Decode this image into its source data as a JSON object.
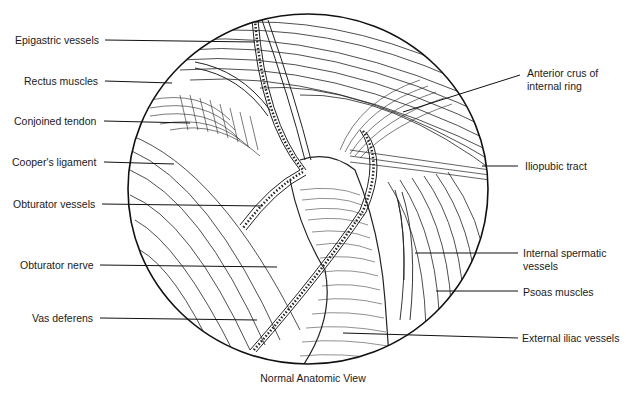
{
  "figure": {
    "caption": "Normal Anatomic View",
    "left_labels": [
      {
        "id": "epigastric-vessels",
        "text": "Epigastric vessels",
        "x": 15,
        "y": 35
      },
      {
        "id": "rectus-muscles",
        "text": "Rectus muscles",
        "x": 24,
        "y": 76
      },
      {
        "id": "conjoined-tendon",
        "text": "Conjoined tendon",
        "x": 14,
        "y": 116
      },
      {
        "id": "coopers-ligament",
        "text": "Cooper's ligament",
        "x": 12,
        "y": 155
      },
      {
        "id": "obturator-vessels",
        "text": "Obturator vessels",
        "x": 13,
        "y": 197
      },
      {
        "id": "obturator-nerve",
        "text": "Obturator nerve",
        "x": 20,
        "y": 258
      },
      {
        "id": "vas-deferens",
        "text": "Vas deferens",
        "x": 32,
        "y": 311
      }
    ],
    "right_labels": [
      {
        "id": "anterior-crus",
        "line1": "Anterior crus of",
        "line2": "internal ring",
        "x": 527,
        "y": 66
      },
      {
        "id": "iliopubic-tract",
        "text": "Iliopubic tract",
        "x": 525,
        "y": 160
      },
      {
        "id": "internal-spermatic-vessels",
        "line1": "Internal spermatic",
        "line2": "vessels",
        "x": 523,
        "y": 247
      },
      {
        "id": "psoas-muscles",
        "text": "Psoas muscles",
        "x": 523,
        "y": 287
      },
      {
        "id": "external-iliac-vessels",
        "text": "External iliac vessels",
        "x": 522,
        "y": 333
      }
    ]
  }
}
